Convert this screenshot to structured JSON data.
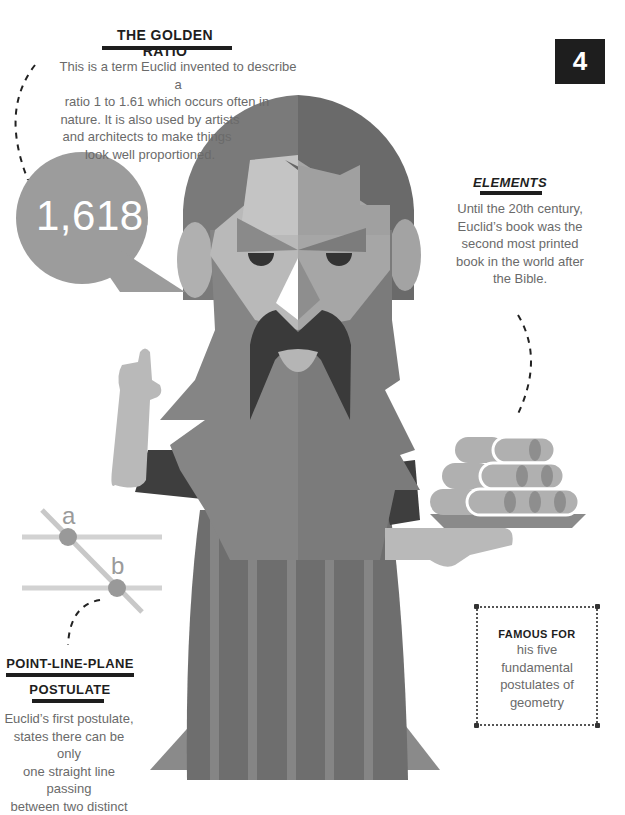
{
  "page_number": "4",
  "golden_ratio": {
    "title": "THE GOLDEN RATIO",
    "lines": [
      "This is a term Euclid invented to describe a",
      "ratio 1 to 1.61 which occurs often in",
      "nature. It is also used by artists",
      "and architects to make things",
      "look well proportioned."
    ],
    "bubble_value": "1,618..."
  },
  "elements": {
    "title": "ELEMENTS",
    "lines": [
      "Until the 20th century,",
      "Euclid’s book was the",
      "second most printed",
      "book in the world after",
      "the Bible."
    ]
  },
  "postulate": {
    "title_line1": "POINT-LINE-PLANE",
    "title_line2": "POSTULATE",
    "diagram_labels": {
      "a": "a",
      "b": "b"
    },
    "lines": [
      "Euclid’s first postulate,",
      "states there can be only",
      "one straight line passing",
      "between two distinct"
    ]
  },
  "famous_for": {
    "title": "FAMOUS FOR",
    "lines": [
      "his five",
      "fundamental",
      "postulates of",
      "geometry"
    ]
  },
  "colors": {
    "black": "#1e1e1e",
    "robe_dark": "#6e6e6e",
    "robe_stripe": "#858585",
    "hair_dark": "#7a7a7a",
    "skin_light": "#b9b9b9",
    "mustache": "#3a3a3a",
    "bubble": "#9c9c9c"
  }
}
